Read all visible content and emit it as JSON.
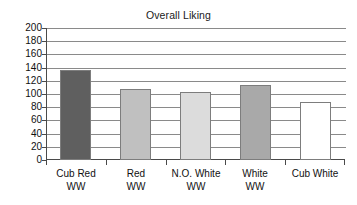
{
  "chart_data": {
    "type": "bar",
    "title": "Overall Liking",
    "xlabel": "",
    "ylabel": "",
    "ylim": [
      0,
      200
    ],
    "ytick_step": 20,
    "yticks": [
      "200",
      "180",
      "160",
      "140",
      "120",
      "100",
      "80",
      "60",
      "40",
      "20",
      "0"
    ],
    "grid": true,
    "legend": "none",
    "categories": [
      "Cub Red WW",
      "Red WW",
      "N.O. White WW",
      "White WW",
      "Cub White"
    ],
    "category_lines": [
      {
        "line1": "Cub Red",
        "line2": "WW"
      },
      {
        "line1": "Red",
        "line2": "WW"
      },
      {
        "line1": "N.O. White",
        "line2": "WW"
      },
      {
        "line1": "White",
        "line2": "WW"
      },
      {
        "line1": "Cub White",
        "line2": ""
      }
    ],
    "values": [
      136,
      107,
      103,
      114,
      88
    ],
    "bar_colors": [
      "#5f5f5f",
      "#c0c0c0",
      "#dcdcdc",
      "#a9a9a9",
      "#ffffff"
    ],
    "bar_border_color": "#7d7d7d"
  },
  "colors": {
    "background": "#ffffff",
    "axis": "#4a4a4a",
    "gridline": "#8a8a8a",
    "text": "#111111"
  }
}
